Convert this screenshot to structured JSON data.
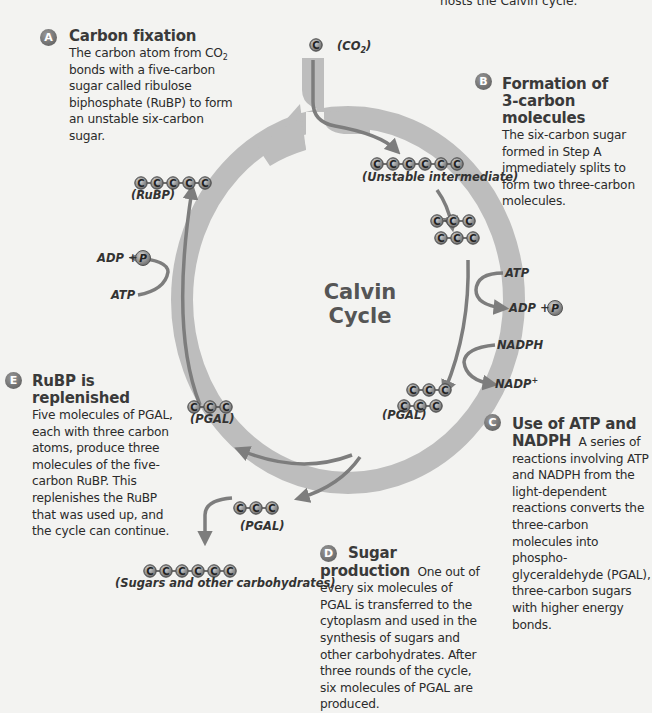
{
  "top_caption": "hosts the Calvin cycle.",
  "center": {
    "line1": "Calvin",
    "line2": "Cycle"
  },
  "colors": {
    "background": "#f3f3f1",
    "ring": "#bdbdbd",
    "arrow": "#7d7d7d",
    "carbon_fill": "#a0a0a0",
    "badge": "#777777",
    "text": "#2b2b2b"
  },
  "steps": {
    "A": {
      "letter": "A",
      "title": "Carbon fixation",
      "body_pre": "The carbon atom from CO",
      "body_sub": "2",
      "body_post": " bonds with a five-carbon sugar called ribulose biphosphate (RuBP) to form an unstable six-carbon sugar."
    },
    "B": {
      "letter": "B",
      "title_line1": "Formation of",
      "title_line2": "3-carbon molecules",
      "body": "The six-carbon sugar formed in Step A immediately splits to form two three-carbon molecules."
    },
    "C": {
      "letter": "C",
      "title_line1": "Use of ATP and",
      "title_line2": "NADPH",
      "body": "A series of reactions involving ATP and NADPH from the light-dependent reactions converts the three-carbon molecules into phospho-glyceraldehyde (PGAL), three-carbon sugars with higher energy bonds."
    },
    "D": {
      "letter": "D",
      "title": "Sugar production",
      "body": "One out of every six molecules of PGAL is transferred to the cytoplasm and used in the synthesis of sugars and other carbohydrates. After three rounds of the cycle, six molecules of PGAL are produced."
    },
    "E": {
      "letter": "E",
      "title": "RuBP is replenished",
      "body": "Five molecules of PGAL, each with three carbon atoms, produce three molecules of the five-carbon RuBP. This replenishes the RuBP that was used up, and the cycle can continue."
    }
  },
  "molecules": {
    "co2": {
      "label": "(CO2)",
      "carbons": 1
    },
    "rubp": {
      "label": "(RuBP)",
      "carbons": 5
    },
    "unstable": {
      "label": "(Unstable intermediate)",
      "carbons": 6
    },
    "split": {
      "carbons_per_row": 3,
      "rows": 2
    },
    "pgal_right": {
      "label": "(PGAL)",
      "carbons_per_row": 3,
      "rows": 2
    },
    "pgal_left": {
      "label": "(PGAL)",
      "carbons": 3
    },
    "pgal_out": {
      "label": "(PGAL)",
      "carbons": 3
    },
    "sugars": {
      "label": "(Sugars and other carbohydrates)",
      "carbons": 6
    }
  },
  "reagents": {
    "left_in": "ATP",
    "left_out_pre": "ADP +",
    "right_atp": "ATP",
    "right_adp_pre": "ADP +",
    "nadph": "NADPH",
    "nadp": "NADP",
    "nadp_sup": "+",
    "phosphate": "P",
    "carbon": "C"
  }
}
